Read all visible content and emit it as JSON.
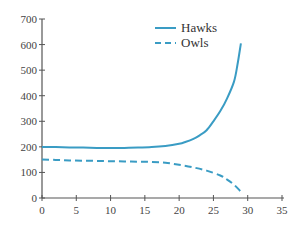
{
  "chart_data": {
    "type": "line",
    "title": "",
    "xlabel": "",
    "ylabel": "",
    "xlim": [
      0,
      35
    ],
    "ylim": [
      0,
      700
    ],
    "xticks": [
      0,
      5,
      10,
      15,
      20,
      25,
      30,
      35
    ],
    "yticks": [
      0,
      100,
      200,
      300,
      400,
      500,
      600,
      700
    ],
    "grid": false,
    "legend_position": "upper center",
    "series": [
      {
        "name": "Hawks",
        "style": "solid",
        "color": "#3a9cc4",
        "x": [
          0,
          2,
          4,
          6,
          8,
          10,
          12,
          14,
          16,
          18,
          20,
          21,
          22,
          23,
          24,
          25,
          26,
          27,
          28,
          28.5,
          29
        ],
        "y": [
          200,
          199,
          198,
          197,
          196,
          196,
          196,
          197,
          199,
          203,
          212,
          220,
          230,
          245,
          265,
          300,
          340,
          390,
          455,
          520,
          605
        ]
      },
      {
        "name": "Owls",
        "style": "dashed",
        "color": "#3a9cc4",
        "x": [
          0,
          2,
          4,
          6,
          8,
          10,
          12,
          14,
          16,
          18,
          20,
          22,
          24,
          26,
          27,
          28,
          29
        ],
        "y": [
          150,
          149,
          147,
          146,
          145,
          144,
          143,
          142,
          141,
          138,
          130,
          120,
          107,
          88,
          72,
          52,
          25
        ]
      }
    ]
  }
}
